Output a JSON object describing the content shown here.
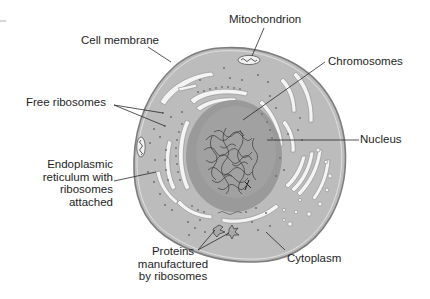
{
  "diagram": {
    "type": "labeled-cell-diagram",
    "colors": {
      "background": "#ffffff",
      "cytoplasm": "#bdbdbd",
      "membrane_edge": "#8a8a8a",
      "nucleus": "#8f8f8f",
      "organelle_channel": "#f4f4f4",
      "ribosome_dot": "#6f6f6f",
      "label_text": "#1e1e1e",
      "leader_line": "#2a2a2a"
    },
    "labels": {
      "mitochondrion": "Mitochondrion",
      "cell_membrane": "Cell membrane",
      "chromosomes": "Chromosomes",
      "free_ribosomes": "Free ribosomes",
      "nucleus": "Nucleus",
      "er_lines": [
        "Endoplasmic",
        "reticulum with",
        "ribosomes",
        "attached"
      ],
      "proteins_lines": [
        "Proteins",
        "manufactured",
        "by ribosomes"
      ],
      "cytoplasm": "Cytoplasm"
    }
  }
}
